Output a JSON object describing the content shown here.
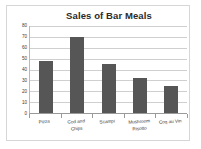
{
  "chart_data": {
    "type": "bar",
    "title": "Sales of Bar Meals",
    "categories": [
      "Pizza",
      "Cod and\nChips",
      "Scampi",
      "Mushroom\nRisotto",
      "Coq au Vin"
    ],
    "values": [
      48,
      70,
      45,
      32,
      25
    ],
    "xlabel": "",
    "ylabel": "",
    "ylim": [
      0,
      80
    ],
    "ytick_labels": [
      "80",
      "70",
      "60",
      "50",
      "40",
      "30",
      "20",
      "10",
      "0"
    ],
    "ytick_values": [
      80,
      70,
      60,
      50,
      40,
      30,
      20,
      10,
      0
    ],
    "grid": true,
    "legend": false,
    "bar_color": "#565656",
    "gridline_color": "#cfcfcf",
    "axis_color": "#9a9a9a",
    "title_color": "#2b2b2b",
    "background": "#ffffff",
    "border_color": "#d6d6d6"
  }
}
